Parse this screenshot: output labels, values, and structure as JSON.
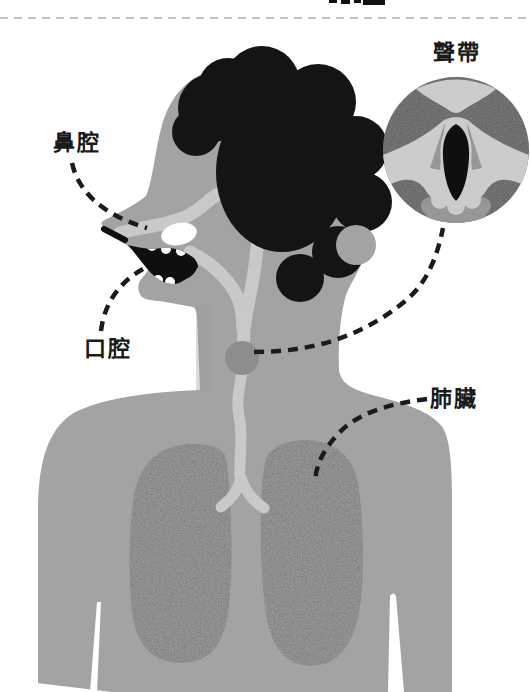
{
  "figure": {
    "title_fragment_note": "clipped text at very top edge (illegible, cut off)",
    "labels": {
      "nasal_cavity": "鼻腔",
      "oral_cavity": "口腔",
      "vocal_cords": "聲帶",
      "lungs": "肺臟"
    },
    "colors": {
      "background": "#ffffff",
      "top_rule": "#c2c2c2",
      "label_text": "#1a1a1a",
      "leader_line": "#1b1b1b",
      "body": "#a3a3a3",
      "body_shadow": "#989898",
      "airway": "#c9c9c9",
      "lungs_fill": "#b6b6b6",
      "larynx": "#8d8d8d",
      "inset_bg": "#8f8f8f",
      "inset_light": "#cccccc",
      "inset_mid": "#979797",
      "hair": "#141414",
      "mouth": "#0f0f0f",
      "teeth": "#ffffff"
    }
  }
}
